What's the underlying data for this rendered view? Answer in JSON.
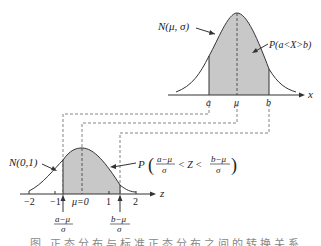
{
  "diagram": {
    "top_curve": {
      "label": "N(μ,  σ)",
      "region_label": "P(a<X>b)",
      "axis_var": "x",
      "ticks": [
        "a",
        "μ",
        "b"
      ]
    },
    "bottom_curve": {
      "label": "N(0,1)",
      "region_label_prefix": "P",
      "lower_num": "a−μ",
      "lower_den": "σ",
      "mid": "< Z <",
      "upper_num": "b−μ",
      "upper_den": "σ",
      "axis_var": "z",
      "ticks": [
        "−2",
        "−1",
        "μ=0",
        "1",
        "2"
      ],
      "marker_a_num": "a−μ",
      "marker_a_den": "σ",
      "marker_b_num": "b−μ",
      "marker_b_den": "σ"
    },
    "colors": {
      "shade": "#c8c8c8",
      "line": "#333333",
      "dash": "#555555"
    }
  },
  "caption": "图   正态分布与标准正态分布之间的转换关系"
}
